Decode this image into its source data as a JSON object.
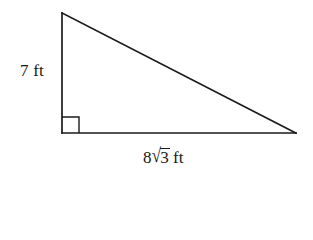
{
  "figure": {
    "type": "right-triangle",
    "background_color": "#ffffff",
    "stroke_color": "#1a1a1a",
    "stroke_width": 1.6,
    "vertices": {
      "apex": {
        "x": 62,
        "y": 13
      },
      "right_angle": {
        "x": 62,
        "y": 133
      },
      "base_right": {
        "x": 296,
        "y": 133
      }
    },
    "right_angle_marker": {
      "name": "right-angle-square",
      "x": 62,
      "y": 117,
      "size": 17
    }
  },
  "labels": {
    "vertical_leg": {
      "text": "7 ft",
      "value": "7",
      "unit": "ft",
      "position": {
        "x": 20,
        "y": 62
      }
    },
    "base_leg": {
      "coefficient": "8",
      "radicand": "3",
      "unit": "ft",
      "text": "8√3 ft",
      "position": {
        "x": 143,
        "y": 148
      }
    }
  }
}
